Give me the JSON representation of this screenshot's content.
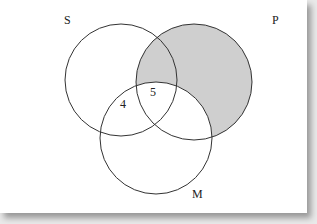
{
  "diagram": {
    "type": "venn",
    "sets": [
      {
        "name": "S",
        "cx": 121,
        "cy": 80,
        "r": 56,
        "label_x": 64,
        "label_y": 24
      },
      {
        "name": "P",
        "cx": 194,
        "cy": 82,
        "r": 58,
        "label_x": 272,
        "label_y": 24
      },
      {
        "name": "M",
        "cx": 156,
        "cy": 138,
        "r": 56,
        "label_x": 192,
        "label_y": 198
      }
    ],
    "region_values": [
      {
        "region": "S∩M only",
        "value": "4",
        "x": 124,
        "y": 108
      },
      {
        "region": "S∩P∩M",
        "value": "5",
        "x": 154,
        "y": 96
      }
    ],
    "shaded_region": "P minus M",
    "shade_color": "#cfcfcf",
    "line_color": "#333333"
  }
}
